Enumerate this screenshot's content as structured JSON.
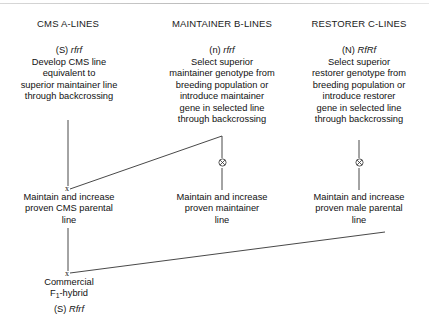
{
  "diagram": {
    "columns": [
      {
        "header": "CMS A-LINES",
        "genotype_prefix": "(S)",
        "genotype_allele": "rfrf",
        "body": [
          "Develop CMS line",
          "equivalent to",
          "superior maintainer line",
          "through backcrossing"
        ],
        "maintain": [
          "Maintain and increase",
          "proven CMS parental",
          "line"
        ]
      },
      {
        "header": "MAINTAINER B-LINES",
        "genotype_prefix": "(n)",
        "genotype_allele": "rfrf",
        "body": [
          "Select superior",
          "maintainer genotype from",
          "breeding population or",
          "introduce maintainer",
          "gene in selected line",
          "through backcrossing"
        ],
        "maintain": [
          "Maintain and increase",
          "proven maintainer",
          "line"
        ]
      },
      {
        "header": "RESTORER C-LINES",
        "genotype_prefix": "(N)",
        "genotype_allele": "RfRf",
        "body": [
          "Select superior",
          "restorer genotype from",
          "breeding population or",
          "introduce restorer",
          "gene in selected line",
          "through backcrossing"
        ],
        "maintain": [
          "Maintain and increase",
          "proven male parental",
          "line"
        ]
      }
    ],
    "product": {
      "line1": "Commercial",
      "line2_prefix": "F",
      "line2_subscript": "1",
      "line2_suffix": "-hybrid",
      "genotype_prefix": "(S)",
      "genotype_allele": "Rfrf"
    },
    "symbols": {
      "cross": "x",
      "selfing": "selfing-circle-cross"
    },
    "colors": {
      "line": "#333333",
      "text": "#111111",
      "background": "#ffffff"
    }
  }
}
